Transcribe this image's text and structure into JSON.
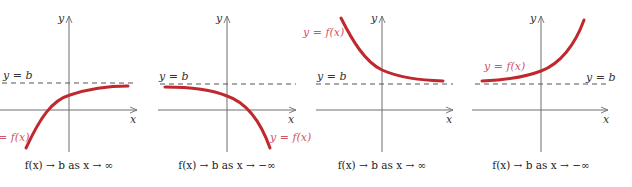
{
  "colors": {
    "curve": "#c0282e",
    "curve_label": "#d0566a",
    "axis": "#6e6e6e",
    "asymptote": "#555555",
    "text": "#222222"
  },
  "panels": [
    {
      "y_axis_label": "y",
      "x_axis_label": "x",
      "asymptote_label": "y = b",
      "curve_label": "= f(x)",
      "caption": "f(x) → b as x → ∞"
    },
    {
      "y_axis_label": "y",
      "x_axis_label": "x",
      "asymptote_label": "y = b",
      "curve_label": "y = f(x)",
      "caption": "f(x) → b as x → −∞"
    },
    {
      "y_axis_label": "y",
      "x_axis_label": "x",
      "asymptote_label": "y = b",
      "curve_label": "y = f(x)",
      "caption": "f(x) → b as x → ∞"
    },
    {
      "y_axis_label": "y",
      "x_axis_label": "x",
      "asymptote_label": "y = b",
      "curve_label": "y = f(x)",
      "caption": "f(x) → b as x → −∞"
    }
  ]
}
